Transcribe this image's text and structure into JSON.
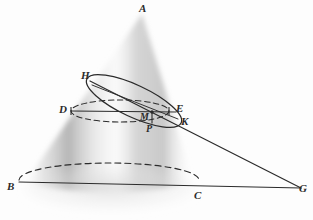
{
  "figure": {
    "width": 313,
    "height": 220,
    "background_color": "#fdfdfd",
    "ink_color": "#2b2b2b",
    "cone_shade_light": "#f4f4f4",
    "cone_shade_mid": "#c9c9c9",
    "cone_shade_dark": "#a8a8a8"
  },
  "labels": {
    "apex": "A",
    "base_left": "B",
    "base_right": "C",
    "far_right": "G",
    "section_upper_left": "H",
    "circle_left": "D",
    "circle_right": "E",
    "section_lower_right": "K",
    "center": "M",
    "foot": "P"
  },
  "geometry": {
    "apex": [
      142,
      14
    ],
    "base_left": [
      19,
      188
    ],
    "base_right": [
      199,
      189
    ],
    "far_right": [
      301,
      189
    ],
    "section_upper_left": [
      90,
      79
    ],
    "circle_left": [
      71,
      110
    ],
    "circle_right": [
      170,
      110
    ],
    "section_lower_right": [
      179,
      123
    ],
    "center": [
      152,
      115
    ],
    "foot": [
      152,
      124
    ],
    "base_ellipse": {
      "cx": 109,
      "cy": 176,
      "rx": 90,
      "ry": 17
    },
    "mid_circle": {
      "cx": 120,
      "cy": 112,
      "rx": 49,
      "ry": 11
    },
    "tilted_ellipse": {
      "cx": 134,
      "cy": 101,
      "rx": 52,
      "ry": 16,
      "rotation_deg": 25
    }
  },
  "elements": {
    "base_front_arc": "solid chord B to C",
    "base_back_arc": "dashed",
    "mid_circle_style": "dashed",
    "tilted_section_style": "solid",
    "line_to_g": "solid from H through M and K to G",
    "base_axis_line": "solid from B through C to G"
  }
}
